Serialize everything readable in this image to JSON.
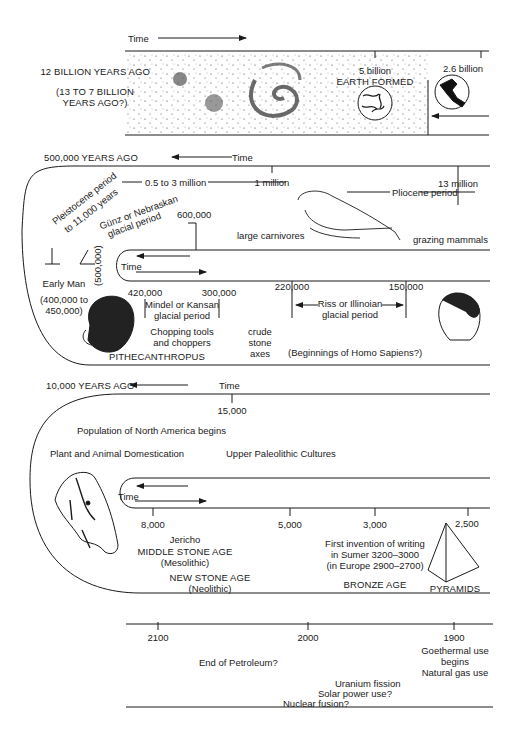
{
  "band1": {
    "time_label": "Time",
    "start_label": "12 BILLION YEARS AGO",
    "range_note": "(13 TO 7 BILLION YEARS AGO?)",
    "range_note_line1": "(13 TO 7 BILLION",
    "range_note_line2": "YEARS AGO?)",
    "earth_value": "5 billion",
    "earth_label": "EARTH FORMED",
    "tick_2_6": "2.6 billion"
  },
  "band2": {
    "start_label": "500,000 YEARS AGO",
    "time_label": "Time",
    "one_million": "1 million",
    "thirteen_million": "13 million",
    "half_to_three": "0.5 to 3 million",
    "pliocene": "Pliocene period",
    "pleistocene_line1": "Pleistocene period",
    "pleistocene_line2": "to 11,000 years",
    "gunz_line1": "Günz or Nebraskan",
    "gunz_line2": "glacial period",
    "six_hundred_k": "600,000",
    "five_hundred_k": "(500,000)",
    "large_carnivores": "large carnivores",
    "grazing_mammals": "grazing mammals",
    "early_man": "Early Man",
    "early_man_range_line1": "(400,000 to",
    "early_man_range_line2": "450,000)",
    "inner_time_label": "Time",
    "tick_420k": "420,000",
    "tick_300k": "300,000",
    "tick_220k": "220,000",
    "tick_150k": "150,000",
    "mindel_line1": "Mindel or Kansan",
    "mindel_line2": "glacial period",
    "riss_line1": "Riss or Illinoian",
    "riss_line2": "glacial period",
    "chopping_line1": "Chopping tools",
    "chopping_line2": "and choppers",
    "crude_line1": "crude",
    "crude_line2": "stone",
    "crude_line3": "axes",
    "pithecanthropus": "PITHECANTHROPUS",
    "homo_sapiens": "(Beginnings of Homo Sapiens?)"
  },
  "band3": {
    "start_label": "10,000 YEARS AGO",
    "time_label": "Time",
    "tick_15k": "15,000",
    "north_america": "Population of North America begins",
    "domestication": "Plant and Animal Domestication",
    "upper_paleolithic": "Upper Paleolithic Cultures",
    "inner_time_label": "Time",
    "tick_8000": "8,000",
    "tick_5000": "5,000",
    "tick_3000": "3,000",
    "tick_2500": "2,500",
    "jericho": "Jericho",
    "middle_stone_age": "MIDDLE STONE AGE",
    "mesolithic": "(Mesolithic)",
    "new_stone_age": "NEW STONE AGE",
    "neolithic": "(Neolithic)",
    "writing_line1": "First invention of writing",
    "writing_line2": "in Sumer 3200–3000",
    "writing_line3": "(in Europe 2900–2700)",
    "bronze_age": "BRONZE AGE",
    "pyramids": "PYRAMIDS"
  },
  "band4": {
    "tick_2100": "2100",
    "tick_2000": "2000",
    "tick_1900": "1900",
    "end_petroleum": "End of Petroleum?",
    "uranium": "Uranium fission",
    "solar": "Solar power use?",
    "fusion": "Nuclear fusion?",
    "geothermal_line1": "Goethermal use",
    "geothermal_line2": "begins",
    "natural_gas": "Natural gas use"
  }
}
